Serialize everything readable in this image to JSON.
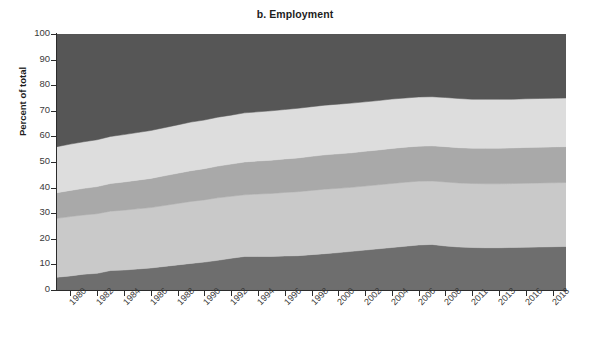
{
  "chart_data": {
    "type": "area",
    "title": "b. Employment",
    "xlabel": "",
    "ylabel": "Percent of total",
    "ylim": [
      0,
      100
    ],
    "ytick_labels": [
      "100",
      "90",
      "80",
      "70",
      "60",
      "50",
      "40",
      "30",
      "20",
      "10",
      "0"
    ],
    "ytick_values": [
      100,
      90,
      80,
      70,
      60,
      50,
      40,
      30,
      20,
      10,
      0
    ],
    "grid": false,
    "legend_position": "none",
    "stacked": true,
    "xtick_labels": [
      "1980",
      "1982",
      "1984",
      "1986",
      "1988",
      "1990",
      "1992",
      "1994",
      "1996",
      "1998",
      "2000",
      "2002",
      "2004",
      "2006",
      "2008",
      "2011",
      "2013",
      "2016",
      "2018"
    ],
    "x": [
      1980,
      1981,
      1982,
      1983,
      1984,
      1985,
      1986,
      1987,
      1988,
      1989,
      1990,
      1991,
      1992,
      1993,
      1994,
      1995,
      1996,
      1997,
      1998,
      1999,
      2000,
      2001,
      2002,
      2003,
      2004,
      2005,
      2006,
      2007,
      2008,
      2009,
      2010,
      2011,
      2012,
      2013,
      2014,
      2015,
      2016,
      2017,
      2018
    ],
    "series": [
      {
        "name": "band-1",
        "color": "#6e6e6e",
        "values": [
          5,
          5.5,
          6.2,
          6.5,
          7.6,
          7.8,
          8.2,
          8.6,
          9.2,
          9.8,
          10.4,
          10.9,
          11.6,
          12.4,
          13.1,
          13.1,
          13.1,
          13.3,
          13.4,
          13.8,
          14.2,
          14.6,
          15.1,
          15.6,
          16.1,
          16.6,
          17.1,
          17.6,
          17.8,
          17.2,
          16.8,
          16.6,
          16.5,
          16.5,
          16.6,
          16.7,
          16.8,
          16.9,
          17.0
        ]
      },
      {
        "name": "band-2",
        "color": "#c9c9c9",
        "values": [
          23.0,
          23.2,
          23.1,
          23.3,
          23.2,
          23.4,
          23.5,
          23.6,
          23.8,
          24.0,
          24.2,
          24.3,
          24.4,
          24.2,
          24.1,
          24.4,
          24.6,
          24.8,
          25.0,
          25.1,
          25.2,
          25.1,
          25.0,
          25.0,
          25.0,
          25.0,
          25.0,
          24.9,
          24.8,
          25.0,
          25.0,
          25.0,
          25.0,
          25.0,
          25.0,
          25.0,
          25.0,
          25.0,
          25.0
        ]
      },
      {
        "name": "band-3",
        "color": "#a9a9a9",
        "values": [
          10.0,
          10.2,
          10.4,
          10.6,
          10.8,
          11.0,
          11.2,
          11.4,
          11.6,
          11.8,
          12.0,
          12.2,
          12.4,
          12.6,
          12.8,
          12.9,
          13.0,
          13.1,
          13.2,
          13.3,
          13.4,
          13.5,
          13.5,
          13.6,
          13.6,
          13.7,
          13.7,
          13.7,
          13.7,
          13.8,
          13.8,
          13.8,
          13.9,
          13.9,
          13.9,
          14.0,
          14.0,
          14.0,
          14.0
        ]
      },
      {
        "name": "band-4",
        "color": "#dddddd",
        "values": [
          18.0,
          18.1,
          18.2,
          18.3,
          18.4,
          18.5,
          18.6,
          18.7,
          18.8,
          18.9,
          19.0,
          19.0,
          19.1,
          19.1,
          19.2,
          19.2,
          19.3,
          19.3,
          19.4,
          19.4,
          19.4,
          19.4,
          19.4,
          19.3,
          19.3,
          19.3,
          19.2,
          19.2,
          19.2,
          19.2,
          19.2,
          19.1,
          19.1,
          19.1,
          19.0,
          19.0,
          19.0,
          19.0,
          19.0
        ]
      },
      {
        "name": "band-5",
        "color": "#565656",
        "values": [
          44.0,
          43.0,
          42.1,
          41.3,
          40.0,
          39.3,
          38.5,
          37.7,
          36.6,
          35.5,
          34.4,
          33.6,
          32.5,
          31.7,
          30.8,
          30.4,
          30.0,
          29.5,
          29.0,
          28.4,
          27.8,
          27.4,
          27.0,
          26.5,
          26.0,
          25.4,
          25.0,
          24.6,
          24.5,
          24.8,
          25.2,
          25.5,
          25.5,
          25.5,
          25.5,
          25.3,
          25.2,
          25.1,
          25.0
        ]
      }
    ]
  }
}
